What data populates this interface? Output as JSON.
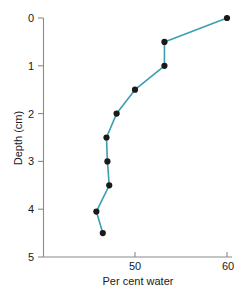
{
  "chart_data": {
    "type": "line",
    "title": "",
    "subtitle": "",
    "xlabel": "Per cent water",
    "ylabel": "Depth (cm)",
    "xlim": [
      40,
      60
    ],
    "ylim": [
      0,
      5
    ],
    "y_inverted": true,
    "grid": false,
    "legend": null,
    "legend_position": "none",
    "xticks": [
      50,
      60
    ],
    "xticklabels": [
      "50",
      "60"
    ],
    "yticks": [
      0,
      1,
      2,
      3,
      4,
      5
    ],
    "yticklabels": [
      "0",
      "1",
      "2",
      "3",
      "4",
      "5"
    ],
    "series": [
      {
        "name": "Per cent water vs depth",
        "color": "#3a9fb0",
        "marker_color": "#1a1a1a",
        "x": [
          60.0,
          53.2,
          53.2,
          50.0,
          48.0,
          46.9,
          47.0,
          47.2,
          45.8,
          46.5
        ],
        "y": [
          0.0,
          0.5,
          1.0,
          1.5,
          2.0,
          2.5,
          3.0,
          3.5,
          4.05,
          4.5
        ]
      }
    ]
  },
  "axis": {
    "x_title": "Per cent water",
    "y_title": "Depth (cm)",
    "x_tick_50": "50",
    "x_tick_60": "60",
    "y_tick_0": "0",
    "y_tick_1": "1",
    "y_tick_2": "2",
    "y_tick_3": "3",
    "y_tick_4": "4",
    "y_tick_5": "5"
  },
  "colors": {
    "line": "#3a9fb0",
    "marker": "#1a1a1a",
    "axis": "#8a8a8a",
    "text": "#1a1a1a",
    "background": "#ffffff"
  }
}
